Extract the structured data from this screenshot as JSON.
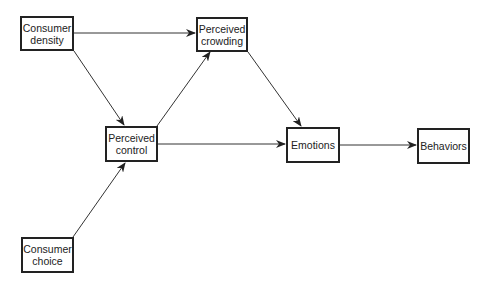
{
  "diagram": {
    "type": "flow",
    "nodes": [
      {
        "id": "density",
        "label": "Consumer\ndensity",
        "x": 20,
        "y": 16,
        "w": 54,
        "h": 35
      },
      {
        "id": "crowding",
        "label": "Perceived\ncrowding",
        "x": 196,
        "y": 17,
        "w": 52,
        "h": 35
      },
      {
        "id": "control",
        "label": "Perceived\ncontrol",
        "x": 105,
        "y": 126,
        "w": 53,
        "h": 36
      },
      {
        "id": "emotions",
        "label": "Emotions",
        "x": 286,
        "y": 127,
        "w": 54,
        "h": 36
      },
      {
        "id": "behaviors",
        "label": "Behaviors",
        "x": 417,
        "y": 128,
        "w": 53,
        "h": 36
      },
      {
        "id": "choice",
        "label": "Consumer\nchoice",
        "x": 21,
        "y": 237,
        "w": 53,
        "h": 36
      }
    ],
    "edges": [
      {
        "from": "density",
        "to": "crowding"
      },
      {
        "from": "density",
        "to": "control"
      },
      {
        "from": "control",
        "to": "crowding"
      },
      {
        "from": "crowding",
        "to": "emotions"
      },
      {
        "from": "control",
        "to": "emotions"
      },
      {
        "from": "emotions",
        "to": "behaviors"
      },
      {
        "from": "choice",
        "to": "control"
      }
    ]
  }
}
